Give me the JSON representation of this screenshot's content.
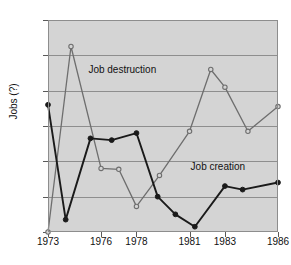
{
  "figure": {
    "background_color": "#ffffff",
    "plot_background_color": "#d4d4d4",
    "grid_color": "#8e8e8e"
  },
  "axes": {
    "ylabel": "Jobs (?)",
    "xlabel": "",
    "y_ticks": [
      6,
      8,
      10,
      12,
      14,
      16,
      18
    ],
    "y_tick_labels": [
      "6",
      "8",
      "10",
      "12",
      "14",
      "16",
      "18"
    ],
    "x_ticks": [
      1973,
      1976,
      1978,
      1981,
      1983,
      1986
    ],
    "x_tick_labels": [
      "1973",
      "1976",
      "1978",
      "1981",
      "1983",
      "1986"
    ]
  },
  "annotations": [
    {
      "text": "Job destruction",
      "x": 1977.2,
      "y": 15.1
    },
    {
      "text": "Job creation",
      "x": 1982.6,
      "y": 9.6
    }
  ],
  "chart_data": {
    "type": "line",
    "title": "",
    "xlabel": "",
    "ylabel": "Jobs (?)",
    "xlim": [
      1973,
      1986
    ],
    "ylim": [
      6,
      18
    ],
    "grid": true,
    "legend": "annotated-inline",
    "x": [
      1973,
      1974,
      1975,
      1976,
      1977,
      1978,
      1979,
      1980,
      1981,
      1982,
      1983,
      1984,
      1985,
      1986
    ],
    "series": [
      {
        "name": "Job creation",
        "color": "#1a1a1a",
        "marker": "filled-circle",
        "x": [
          1973,
          1974,
          1975,
          1976,
          1977,
          1978,
          1979,
          1980,
          1981,
          1982,
          1983,
          1984
        ],
        "values": [
          13.2,
          6.7,
          11.3,
          11.2,
          11.6,
          8.0,
          7.0,
          6.3,
          8.6,
          8.4,
          8.8,
          null
        ]
      },
      {
        "name": "Job destruction",
        "color": "#6e6e6e",
        "marker": "open-circle",
        "x": [
          1973,
          1974,
          1975,
          1976,
          1977,
          1978,
          1979,
          1980,
          1981,
          1982,
          1983
        ],
        "values": [
          6.0,
          16.5,
          9.6,
          9.6,
          7.5,
          9.2,
          11.7,
          15.2,
          14.2,
          11.7,
          13.1
        ]
      }
    ],
    "points": {
      "job_creation": [
        {
          "x": 1973,
          "y": 13.2
        },
        {
          "x": 1974,
          "y": 6.7
        },
        {
          "x": 1975.4,
          "y": 11.3
        },
        {
          "x": 1976.6,
          "y": 11.2
        },
        {
          "x": 1978,
          "y": 11.6
        },
        {
          "x": 1979.2,
          "y": 8.0
        },
        {
          "x": 1980.2,
          "y": 7.0
        },
        {
          "x": 1981.3,
          "y": 6.3
        },
        {
          "x": 1983,
          "y": 8.6
        },
        {
          "x": 1984,
          "y": 8.4
        },
        {
          "x": 1986,
          "y": 8.8
        }
      ],
      "job_destruction": [
        {
          "x": 1973,
          "y": 6.0
        },
        {
          "x": 1974.3,
          "y": 16.5
        },
        {
          "x": 1976,
          "y": 9.6
        },
        {
          "x": 1977,
          "y": 9.55
        },
        {
          "x": 1978,
          "y": 7.45
        },
        {
          "x": 1979.3,
          "y": 9.2
        },
        {
          "x": 1981,
          "y": 11.7
        },
        {
          "x": 1982.2,
          "y": 15.2
        },
        {
          "x": 1983,
          "y": 14.2
        },
        {
          "x": 1984.3,
          "y": 11.7
        },
        {
          "x": 1986,
          "y": 13.1
        }
      ]
    }
  }
}
